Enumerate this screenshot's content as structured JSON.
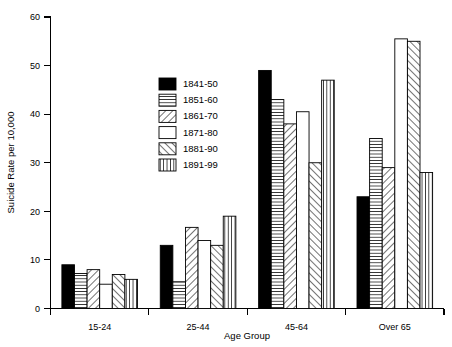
{
  "chart_data": {
    "type": "bar",
    "title": "",
    "xlabel": "Age Group",
    "ylabel": "Suicide Rate per 10,000",
    "categories": [
      "15-24",
      "25-44",
      "45-64",
      "Over 65"
    ],
    "ylim": [
      0,
      60
    ],
    "yticks": [
      0,
      10,
      20,
      30,
      40,
      50,
      60
    ],
    "ytick_labels": [
      "0",
      "10",
      "20",
      "30",
      "40",
      "50",
      "60"
    ],
    "grid": false,
    "legend_position": "upper center",
    "series": [
      {
        "name": "1841-50",
        "pattern": "solid-black",
        "values": [
          9.0,
          13.0,
          49.0,
          23.0
        ]
      },
      {
        "name": "1851-60",
        "pattern": "horizontal-lines",
        "values": [
          7.2,
          5.5,
          43.0,
          35.0
        ]
      },
      {
        "name": "1861-70",
        "pattern": "diagonal-forward",
        "values": [
          8.0,
          16.7,
          38.0,
          29.0
        ]
      },
      {
        "name": "1871-80",
        "pattern": "blank-white",
        "values": [
          5.0,
          14.0,
          40.5,
          55.5
        ]
      },
      {
        "name": "1881-90",
        "pattern": "diagonal-backward",
        "values": [
          7.0,
          13.0,
          30.0,
          55.0
        ]
      },
      {
        "name": "1891-99",
        "pattern": "vertical-lines",
        "values": [
          6.0,
          19.0,
          47.0,
          28.0
        ]
      }
    ]
  },
  "colors": {
    "axis": "#000000",
    "bar_fill_black": "#000000",
    "bar_fill_white": "#ffffff",
    "background": "#ffffff"
  }
}
